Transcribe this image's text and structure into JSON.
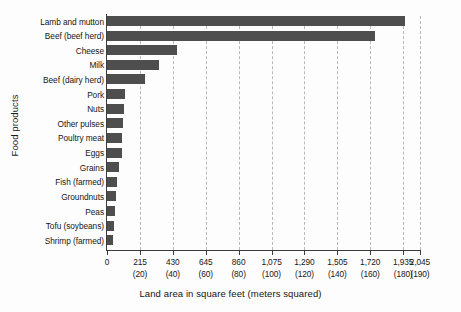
{
  "chart_data": {
    "type": "bar",
    "orientation": "horizontal",
    "title": "",
    "xlabel": "Land area in square feet (meters squared)",
    "ylabel": "Food products",
    "categories": [
      "Lamb and mutton",
      "Beef (beef herd)",
      "Cheese",
      "Milk",
      "Beef (dairy herd)",
      "Pork",
      "Nuts",
      "Other pulses",
      "Poultry meat",
      "Eggs",
      "Grains",
      "Fish (farmed)",
      "Groundnuts",
      "Peas",
      "Tofu (soybeans)",
      "Shrimp (farmed)"
    ],
    "values": [
      1950,
      1750,
      460,
      340,
      250,
      120,
      110,
      105,
      100,
      95,
      80,
      65,
      60,
      55,
      45,
      40
    ],
    "value_unit": "square feet",
    "xlim": [
      0,
      2045
    ],
    "xticks": [
      0,
      215,
      430,
      645,
      860,
      1075,
      1290,
      1505,
      1720,
      1935,
      2045
    ],
    "xtick_labels": [
      "0",
      "215",
      "430",
      "645",
      "860",
      "1,075",
      "1,290",
      "1,505",
      "1,720",
      "1,935",
      "2,045"
    ],
    "xtick_sublabels": [
      "",
      "(20)",
      "(40)",
      "(60)",
      "(80)",
      "(100)",
      "(120)",
      "(140)",
      "(160)",
      "(180)",
      "(190)"
    ],
    "grid": "vertical-dashed",
    "legend": "none",
    "bar_color": "#4e4e4e",
    "grid_color": "#b9b9b9",
    "axis_color": "#3c3c3c",
    "background": "#fdfdfd"
  }
}
